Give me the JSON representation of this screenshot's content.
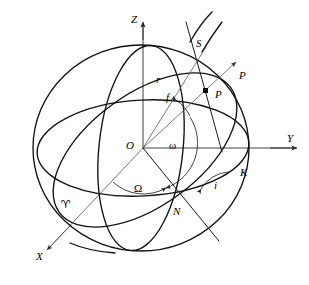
{
  "figure": {
    "kind": "orbital-elements-celestial-sphere-diagram",
    "width": 309,
    "height": 285,
    "background_color": "#ffffff",
    "line_color": "#111111"
  },
  "axes": [
    {
      "id": "z",
      "label": "Z",
      "label_x": 131,
      "label_y": 14,
      "direction": "up",
      "arrow": true
    },
    {
      "id": "y",
      "label": "Y",
      "label_x": 287,
      "label_y": 133,
      "direction": "right",
      "arrow": true
    },
    {
      "id": "x",
      "label": "X",
      "label_x": 36,
      "label_y": 251,
      "direction": "lower-left",
      "arrow": true
    }
  ],
  "points": [
    {
      "id": "origin",
      "label": "O",
      "label_x": 126,
      "label_y": 140,
      "marker": false
    },
    {
      "id": "satellite",
      "label": "P",
      "label_x": 215,
      "label_y": 89,
      "marker": true,
      "marker_x": 205,
      "marker_y": 90
    },
    {
      "id": "perigee-direction",
      "label": "P",
      "label_x": 239,
      "label_y": 70,
      "marker": false
    },
    {
      "id": "ascending-node",
      "label": "N",
      "label_x": 173,
      "label_y": 206,
      "marker": false
    },
    {
      "id": "orbit-pole",
      "label": "S",
      "label_x": 196,
      "label_y": 38,
      "marker": false
    },
    {
      "id": "descending-side",
      "label": "K",
      "label_x": 240,
      "label_y": 167,
      "marker": false
    },
    {
      "id": "vernal-equinox",
      "label": "♈",
      "label_x": 61,
      "label_y": 199,
      "marker": false
    }
  ],
  "angles": [
    {
      "id": "true-anomaly",
      "label": "f",
      "label_x": 166,
      "label_y": 92
    },
    {
      "id": "argument-of-perigee",
      "label": "ω",
      "label_x": 169,
      "label_y": 140
    },
    {
      "id": "raan",
      "label": "Ω",
      "label_x": 134,
      "label_y": 183
    },
    {
      "id": "inclination",
      "label": "i",
      "label_x": 214,
      "label_y": 180
    }
  ],
  "segments": [
    {
      "id": "radius-vector",
      "label": "r",
      "label_x": 156,
      "label_y": 74
    }
  ],
  "curves": [
    {
      "id": "celestial-sphere-outline",
      "description": "main great circle limb of the celestial sphere"
    },
    {
      "id": "equatorial-plane-ellipse",
      "description": "equatorial plane shown in perspective"
    },
    {
      "id": "orbital-plane-ellipse",
      "description": "orbit plane inclined to the equator"
    },
    {
      "id": "meridian-through-pole",
      "description": "great circle through Z and the orbit normal"
    }
  ]
}
